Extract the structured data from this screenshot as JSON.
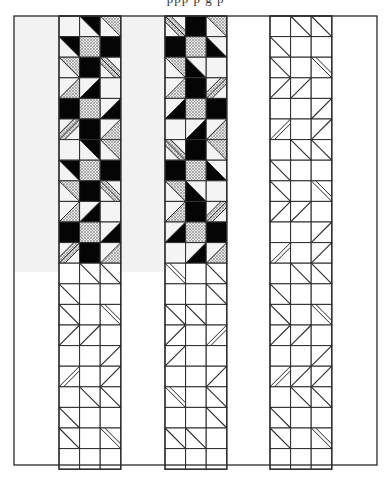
{
  "caption_fragment": "ppp p          g p",
  "figure": {
    "frame": {
      "x": 14,
      "y": 16,
      "w": 363,
      "h": 449
    },
    "shaded_region": {
      "x": 14,
      "y": 16,
      "w": 214,
      "h": 256,
      "color": "#f2f2f2"
    },
    "colors": {
      "line": "#2a2a2a",
      "black": "#050505",
      "dot": "#c8c8c8",
      "background": "#ffffff",
      "cell_light": "#f4f4f4"
    },
    "cell_size": 20.6,
    "rows": 22,
    "strips": [
      {
        "name": "strip-1",
        "x": 59,
        "filled_rows": 12
      },
      {
        "name": "strip-2",
        "x": 165,
        "filled_rows": 12
      },
      {
        "name": "strip-3",
        "x": 270,
        "filled_rows": 0
      }
    ],
    "legend_of_codes": {
      "E": "empty square",
      "B": "solid black square",
      "D": "dotted square",
      "b\\u": "diagonal \\ black upper-right half",
      "b\\l": "diagonal \\ black lower-left half",
      "b/u": "diagonal / black upper-left half",
      "b/l": "diagonal / black lower-right half",
      "d\\u": "diagonal \\ dotted upper-right half",
      "d\\l": "diagonal \\ dotted lower-left half",
      "d/u": "diagonal / dotted upper-left half",
      "d/l": "diagonal / dotted lower-right half",
      "h\\": "hatched stripe along \\ diagonal",
      "h/": "hatched stripe along / diagonal",
      "o\\": "outline diagonal \\",
      "o/": "outline diagonal /",
      "s\\": "outline double stripe \\",
      "s/": "outline double stripe /"
    },
    "strip_cells": {
      "strip-1": [
        [
          "E",
          "b\\u",
          "d\\u"
        ],
        [
          "b\\u",
          "D",
          "B"
        ],
        [
          "d\\u",
          "B",
          "h\\"
        ],
        [
          "d/l",
          "b/l",
          "E"
        ],
        [
          "B",
          "D",
          "b/l"
        ],
        [
          "h/",
          "B",
          "d/l"
        ],
        [
          "E",
          "b\\u",
          "d\\u"
        ],
        [
          "b\\u",
          "D",
          "B"
        ],
        [
          "d\\u",
          "B",
          "h\\"
        ],
        [
          "d/l",
          "b/l",
          "E"
        ],
        [
          "B",
          "D",
          "b/l"
        ],
        [
          "h/",
          "B",
          "d/l"
        ],
        [
          "E",
          "o\\",
          "o\\"
        ],
        [
          "o\\",
          "E",
          "E"
        ],
        [
          "o\\",
          "E",
          "s\\"
        ],
        [
          "o/",
          "o/",
          "E"
        ],
        [
          "E",
          "E",
          "o/"
        ],
        [
          "s/",
          "E",
          "o/"
        ],
        [
          "E",
          "o\\",
          "o\\"
        ],
        [
          "o\\",
          "E",
          "E"
        ],
        [
          "o\\",
          "E",
          "s\\"
        ],
        [
          "E",
          "E",
          "E"
        ]
      ],
      "strip-2": [
        [
          "h\\",
          "B",
          "d\\u"
        ],
        [
          "B",
          "D",
          "b\\l"
        ],
        [
          "d\\u",
          "b\\l",
          "E"
        ],
        [
          "d/l",
          "B",
          "h/"
        ],
        [
          "b/l",
          "D",
          "B"
        ],
        [
          "E",
          "b/l",
          "d/l"
        ],
        [
          "h\\",
          "B",
          "d\\u"
        ],
        [
          "B",
          "D",
          "b\\l"
        ],
        [
          "d\\u",
          "b\\l",
          "E"
        ],
        [
          "d/l",
          "B",
          "h/"
        ],
        [
          "b/l",
          "D",
          "B"
        ],
        [
          "E",
          "b/l",
          "d/l"
        ],
        [
          "s\\",
          "E",
          "o\\"
        ],
        [
          "E",
          "E",
          "o\\"
        ],
        [
          "o\\",
          "o\\",
          "E"
        ],
        [
          "o/",
          "E",
          "s/"
        ],
        [
          "o/",
          "E",
          "E"
        ],
        [
          "E",
          "E",
          "o/"
        ],
        [
          "s\\",
          "E",
          "o\\"
        ],
        [
          "E",
          "E",
          "o\\"
        ],
        [
          "o\\",
          "o\\",
          "E"
        ],
        [
          "E",
          "E",
          "E"
        ]
      ],
      "strip-3": [
        [
          "E",
          "o\\",
          "o\\"
        ],
        [
          "o\\",
          "E",
          "E"
        ],
        [
          "o\\",
          "E",
          "s\\"
        ],
        [
          "o/",
          "o/",
          "E"
        ],
        [
          "E",
          "E",
          "o/"
        ],
        [
          "s/",
          "E",
          "o/"
        ],
        [
          "E",
          "o\\",
          "o\\"
        ],
        [
          "o\\",
          "E",
          "E"
        ],
        [
          "o\\",
          "E",
          "s\\"
        ],
        [
          "o/",
          "o/",
          "E"
        ],
        [
          "E",
          "E",
          "o/"
        ],
        [
          "s/",
          "E",
          "o/"
        ],
        [
          "E",
          "o\\",
          "o\\"
        ],
        [
          "o\\",
          "E",
          "E"
        ],
        [
          "o\\",
          "E",
          "s\\"
        ],
        [
          "o/",
          "o/",
          "E"
        ],
        [
          "E",
          "E",
          "o/"
        ],
        [
          "s/",
          "o/",
          "o/"
        ],
        [
          "E",
          "o\\",
          "o\\"
        ],
        [
          "o\\",
          "E",
          "E"
        ],
        [
          "o\\",
          "E",
          "s\\"
        ],
        [
          "E",
          "E",
          "E"
        ]
      ]
    }
  }
}
